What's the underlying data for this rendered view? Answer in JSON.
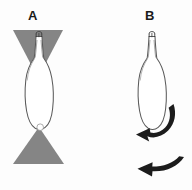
{
  "figure": {
    "background_color": "#fdfdfd",
    "width": 192,
    "height": 190,
    "panels": [
      {
        "id": "A",
        "label": "A",
        "label_x": 28,
        "label_y": 9,
        "description": "Flask-shaped outlined cell between two opposing gray cones"
      },
      {
        "id": "B",
        "label": "B",
        "label_x": 145,
        "label_y": 9,
        "description": "Same flask-shaped outlined cell with black curved motion arrows"
      }
    ]
  },
  "colors": {
    "cone_gray": "#858585",
    "outline": "#5a5a5a",
    "arrow_black": "#1c1c1c",
    "label_text": "#1a1a1a",
    "cell_fill": "#ffffff",
    "background": "#fdfdfd"
  },
  "shapes": {
    "panel_a": {
      "top_cone": {
        "name": "top-gray-cone",
        "points": "13,30 63,30 38,76",
        "fill": "#858585"
      },
      "bottom_cone": {
        "name": "bottom-gray-cone",
        "points": "38,128 63,164 13,164",
        "fill": "#858585"
      },
      "cell_body": {
        "name": "flask-cell-outline",
        "fill": "#ffffff",
        "stroke": "#5a5a5a"
      },
      "neck_marker": {
        "name": "apical-neck",
        "stroke": "#4a4a4a"
      },
      "basal_dot": {
        "name": "basal-white-dot",
        "cx": 41,
        "cy": 128,
        "r": 3.2,
        "fill": "#ffffff"
      }
    },
    "panel_b": {
      "cell_body": {
        "name": "flask-cell-outline",
        "fill": "#ffffff",
        "stroke": "#5a5a5a"
      },
      "curved_arrow": {
        "name": "rotation-arrow",
        "fill": "#1c1c1c",
        "direction": "counterclockwise-down-left"
      },
      "straight_arrow": {
        "name": "translation-arrow",
        "fill": "#1c1c1c",
        "direction": "left"
      }
    }
  }
}
